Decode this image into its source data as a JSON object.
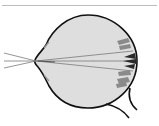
{
  "figure": {
    "colors": {
      "eyeball_fill": "#dedede",
      "outline": "#111111",
      "rays": "#7a7a7a",
      "retina_light": "#8a8a8a",
      "retina_dark": "#2a2a2a",
      "rule": "#bdbdbd"
    },
    "rays": [
      {
        "from": [
          4,
          53
        ],
        "to": [
          133,
          51
        ]
      },
      {
        "from": [
          4,
          61
        ],
        "to": [
          136,
          61
        ]
      },
      {
        "from": [
          4,
          68
        ],
        "to": [
          133,
          70
        ]
      }
    ]
  }
}
